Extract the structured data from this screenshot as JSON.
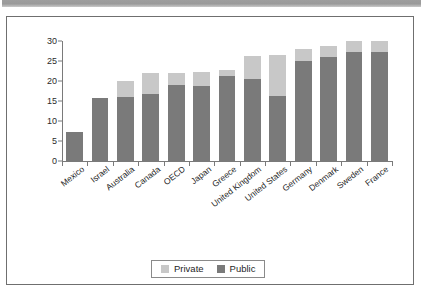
{
  "figure": {
    "top_band_color": "#9e9e9e",
    "frame_color": "#6f6f6f",
    "background": "#ffffff"
  },
  "legend": {
    "position": "bottom-center",
    "entries": [
      {
        "label": "Private",
        "color": "#c8c8c8",
        "swatch_name": "private-swatch"
      },
      {
        "label": "Public",
        "color": "#7a7a7a",
        "swatch_name": "public-swatch"
      }
    ]
  },
  "chart_data": {
    "type": "bar",
    "stacked": true,
    "orientation": "vertical",
    "title": "",
    "subtitle": "",
    "xlabel": "",
    "ylabel": "",
    "ylim": [
      0,
      30
    ],
    "yticks": [
      0,
      5,
      10,
      15,
      20,
      25,
      30
    ],
    "ytick_labels": [
      "0",
      "5",
      "10",
      "15",
      "20",
      "25",
      "30"
    ],
    "grid": false,
    "legend_position": "bottom-center",
    "xtick_label_rotation": -38,
    "categories": [
      "Mexico",
      "Israel",
      "Australia",
      "Canada",
      "OECD",
      "Japan",
      "Greece",
      "United Kingdom",
      "United States",
      "Germany",
      "Denmark",
      "Sweden",
      "France"
    ],
    "series": [
      {
        "name": "Public",
        "color": "#7a7a7a",
        "values": [
          7.3,
          15.7,
          15.9,
          16.8,
          19.1,
          18.8,
          21.2,
          20.5,
          16.2,
          25.0,
          26.0,
          27.3,
          28.4
        ]
      },
      {
        "name": "Private",
        "color": "#c8c8c8",
        "values": [
          0.0,
          0.0,
          4.1,
          5.3,
          3.0,
          3.5,
          1.5,
          5.8,
          10.3,
          3.0,
          2.7,
          2.8,
          3.0
        ]
      }
    ],
    "totals": [
      7.3,
      15.7,
      20.0,
      22.1,
      22.1,
      22.3,
      22.7,
      26.3,
      26.5,
      28.0,
      28.7,
      30.1,
      31.4
    ]
  }
}
